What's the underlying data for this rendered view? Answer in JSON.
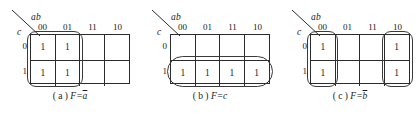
{
  "figure": {
    "type": "karnaugh-map-figure",
    "variable_label_top": "ab",
    "variable_label_side": "c",
    "column_headers": [
      "00",
      "01",
      "11",
      "10"
    ],
    "row_headers": [
      "0",
      "1"
    ],
    "maps": [
      {
        "id": "a",
        "caption_tag": "( a )",
        "caption_lhs": "F=",
        "caption_var": "a",
        "caption_overbar": true,
        "caption_plain": "( a ) F=ā",
        "cells": [
          [
            "1",
            "1",
            "",
            ""
          ],
          [
            "1",
            "1",
            "",
            ""
          ]
        ],
        "groups": [
          {
            "name": "group-cols-00-01",
            "cols": [
              "00",
              "01"
            ],
            "rows": [
              "0",
              "1"
            ]
          }
        ]
      },
      {
        "id": "b",
        "caption_tag": "( b )",
        "caption_lhs": "F=",
        "caption_var": "c",
        "caption_overbar": false,
        "caption_plain": "( b ) F=c",
        "cells": [
          [
            "",
            "",
            "",
            ""
          ],
          [
            "1",
            "1",
            "1",
            "1"
          ]
        ],
        "groups": [
          {
            "name": "group-row-1",
            "cols": [
              "00",
              "01",
              "11",
              "10"
            ],
            "rows": [
              "1"
            ]
          }
        ]
      },
      {
        "id": "c",
        "caption_tag": "( c )",
        "caption_lhs": "F=",
        "caption_var": "b",
        "caption_overbar": true,
        "caption_plain": "( c ) F=b̄",
        "cells": [
          [
            "1",
            "",
            "",
            "1"
          ],
          [
            "1",
            "",
            "",
            "1"
          ]
        ],
        "groups": [
          {
            "name": "group-col-00",
            "cols": [
              "00"
            ],
            "rows": [
              "0",
              "1"
            ]
          },
          {
            "name": "group-col-10",
            "cols": [
              "10"
            ],
            "rows": [
              "0",
              "1"
            ]
          }
        ]
      }
    ]
  },
  "colors": {
    "line": "#2b2b2b",
    "loop": "#3a3a3a",
    "text": "#1a1a1a",
    "background": "#ffffff"
  }
}
